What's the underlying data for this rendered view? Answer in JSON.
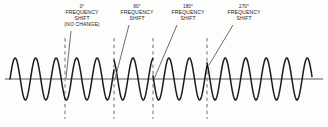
{
  "figure": {
    "background_color": "#fdfdfb",
    "wave_color": "#1a1a1a",
    "axis_color": "#8e8e8e",
    "dashed_color": "#8e8e8e",
    "leader_color": "#55524f",
    "text_color": "#1a1a1a"
  },
  "annotations": [
    {
      "id": "shift-0",
      "degrees": "0°",
      "line1": "FREQUENCY",
      "line2": "SHIFT",
      "line3": "(NO CHANGE)",
      "label_x": 82,
      "label_y": 4,
      "marker_x": 65,
      "leader_from_x": 71,
      "leader_from_y": 31,
      "leader_to_x": 66,
      "leader_to_y": 78
    },
    {
      "id": "shift-90",
      "degrees": "90°",
      "line1": "FREQUENCY",
      "line2": "SHIFT",
      "line3": "",
      "label_x": 137,
      "label_y": 4,
      "marker_x": 114,
      "leader_from_x": 129,
      "leader_from_y": 25,
      "leader_to_x": 115,
      "leader_to_y": 79
    },
    {
      "id": "shift-180",
      "degrees": "180°",
      "line1": "FREQUENCY",
      "line2": "SHIFT",
      "line3": "",
      "label_x": 188,
      "label_y": 4,
      "marker_x": 153,
      "leader_from_x": 177,
      "leader_from_y": 25,
      "leader_to_x": 154,
      "leader_to_y": 79
    },
    {
      "id": "shift-270",
      "degrees": "270°",
      "line1": "FREQUENCY",
      "line2": "SHIFT",
      "line3": "",
      "label_x": 244,
      "label_y": 4,
      "marker_x": 207,
      "leader_from_x": 233,
      "leader_from_y": 25,
      "leader_to_x": 209,
      "leader_to_y": 65
    }
  ],
  "chart_data": {
    "type": "line",
    "xlabel": "",
    "ylabel": "",
    "grid": false,
    "legend": null,
    "baseline_y": 79,
    "amplitude": 21,
    "x_start": 10,
    "x_end": 312,
    "period": 20.5,
    "phase_segments": [
      {
        "label": "0° FREQUENCY SHIFT (NO CHANGE)",
        "x_from": 10,
        "x_to": 65,
        "phase_deg": 0
      },
      {
        "label": "90° FREQUENCY SHIFT",
        "x_from": 65,
        "x_to": 114,
        "phase_deg": 0
      },
      {
        "label": "180° FREQUENCY SHIFT",
        "x_from": 114,
        "x_to": 153,
        "phase_deg": 90
      },
      {
        "label": "270° FREQUENCY SHIFT",
        "x_from": 153,
        "x_to": 207,
        "phase_deg": 180
      },
      {
        "label": "tail",
        "x_from": 207,
        "x_to": 312,
        "phase_deg": 270
      }
    ],
    "markers_x": [
      65,
      114,
      153,
      207
    ]
  }
}
